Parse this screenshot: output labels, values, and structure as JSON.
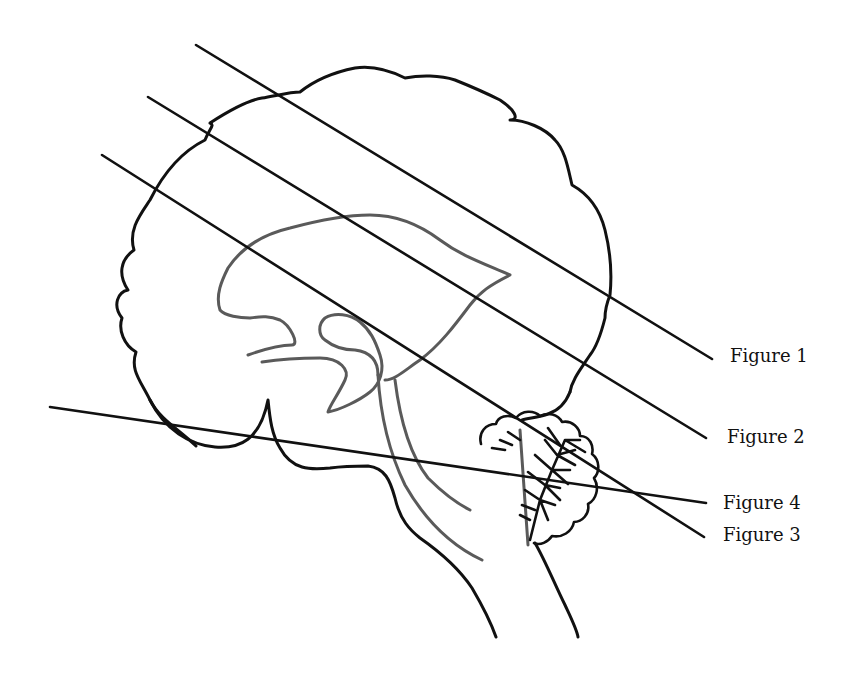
{
  "diagram": {
    "colors": {
      "outline": "#111111",
      "inner_structures": "#5a5a5a",
      "background": "#ffffff"
    },
    "section_lines": [
      {
        "label": "Figure 1",
        "x1": 196,
        "y1": 45,
        "x2": 712,
        "y2": 359,
        "label_x": 730,
        "label_y": 347
      },
      {
        "label": "Figure 2",
        "x1": 148,
        "y1": 97,
        "x2": 706,
        "y2": 438,
        "label_x": 727,
        "label_y": 428
      },
      {
        "label": "Figure 3",
        "x1": 102,
        "y1": 155,
        "x2": 704,
        "y2": 537,
        "label_x": 723,
        "label_y": 526
      },
      {
        "label": "Figure 4",
        "x1": 50,
        "y1": 407,
        "x2": 706,
        "y2": 503,
        "label_x": 723,
        "label_y": 494
      }
    ]
  }
}
